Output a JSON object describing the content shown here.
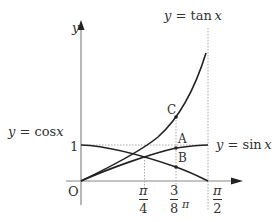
{
  "diagram": {
    "axes": {
      "x_label": "",
      "y_label": "y",
      "origin_label": "O",
      "one_label": "1"
    },
    "curves": {
      "tan": {
        "label_prefix": "y = ",
        "label_fn": "tan",
        "label_var": "x"
      },
      "cos": {
        "label_prefix": "y = ",
        "label_fn": "cos",
        "label_var": "x"
      },
      "sin": {
        "label_prefix": "y = ",
        "label_fn": "sin",
        "label_var": "x"
      }
    },
    "points": {
      "A": "A",
      "B": "B",
      "C": "C"
    },
    "ticks": {
      "pi_over_4": {
        "num": "π",
        "den": "4"
      },
      "three_eighths_pi": {
        "num": "3",
        "den": "8",
        "suffix": "π"
      },
      "pi_over_2": {
        "num": "π",
        "den": "2"
      }
    },
    "colors": {
      "curve": "#222222",
      "axis": "#888888",
      "guide": "#999999",
      "text": "#333333"
    }
  }
}
